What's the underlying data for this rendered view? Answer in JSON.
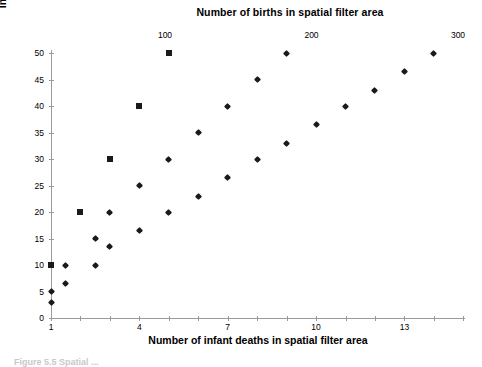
{
  "figure": {
    "top_axis": {
      "title": "Number of births in spatial filter area",
      "ticks": [
        {
          "label": "100",
          "value": 100
        },
        {
          "label": "200",
          "value": 200
        },
        {
          "label": "300",
          "value": 300
        }
      ]
    },
    "caption": "Figure 5.5   Spatial ..."
  },
  "chart_data": {
    "type": "scatter",
    "title": "",
    "xlabel": "Number of infant deaths in spatial filter area",
    "ylabel": "Infant mortality rate (/1000 births)",
    "top_xlabel": "Number of births in spatial filter area",
    "grid": false,
    "legend": "none",
    "xlim": [
      0.5,
      15.5
    ],
    "ylim": [
      0,
      50
    ],
    "yticks": [
      0,
      5,
      10,
      15,
      20,
      25,
      30,
      35,
      40,
      45,
      50
    ],
    "ytick_labels": [
      "0",
      "5",
      "10",
      "15",
      "20",
      "25",
      "30",
      "35",
      "40",
      "45",
      "50"
    ],
    "xticks": [
      1,
      2,
      3,
      4,
      5,
      6,
      7,
      8,
      9,
      10,
      11,
      12,
      13,
      14,
      15
    ],
    "xtick_labels": [
      "1",
      "",
      "",
      "4",
      "",
      "",
      "7",
      "",
      "",
      "10",
      "",
      "",
      "13",
      "",
      ""
    ],
    "top_xlim": [
      0,
      330
    ],
    "top_xticks": [
      100,
      200,
      300
    ],
    "top_xtick_labels": [
      "100",
      "200",
      "300"
    ],
    "series": [
      {
        "name": "Infant deaths (squares)",
        "marker": "square",
        "color": "#1a1a1a",
        "axis": "bottom",
        "points": [
          {
            "x": 1,
            "y": 10
          },
          {
            "x": 2,
            "y": 20
          },
          {
            "x": 3,
            "y": 30
          },
          {
            "x": 4,
            "y": 40
          },
          {
            "x": 5,
            "y": 50
          }
        ]
      },
      {
        "name": "Births (diamonds)",
        "marker": "diamond",
        "color": "#1a1a1a",
        "axis": "bottom",
        "points": [
          {
            "x": 1.0,
            "y": 5.0
          },
          {
            "x": 1.0,
            "y": 3.0
          },
          {
            "x": 1.5,
            "y": 10.0
          },
          {
            "x": 1.5,
            "y": 6.5
          },
          {
            "x": 2.5,
            "y": 10.0
          },
          {
            "x": 2.5,
            "y": 15.0
          },
          {
            "x": 3.0,
            "y": 13.5
          },
          {
            "x": 3.0,
            "y": 20.0
          },
          {
            "x": 4.0,
            "y": 16.5
          },
          {
            "x": 4.0,
            "y": 25.0
          },
          {
            "x": 5.0,
            "y": 20.0
          },
          {
            "x": 5.0,
            "y": 30.0
          },
          {
            "x": 6.0,
            "y": 23.0
          },
          {
            "x": 6.0,
            "y": 35.0
          },
          {
            "x": 7.0,
            "y": 26.5
          },
          {
            "x": 7.0,
            "y": 40.0
          },
          {
            "x": 8.0,
            "y": 30.0
          },
          {
            "x": 8.0,
            "y": 45.0
          },
          {
            "x": 9.0,
            "y": 33.0
          },
          {
            "x": 9.0,
            "y": 50.0
          },
          {
            "x": 10.0,
            "y": 36.5
          },
          {
            "x": 11.0,
            "y": 40.0
          },
          {
            "x": 12.0,
            "y": 43.0
          },
          {
            "x": 13.0,
            "y": 46.5
          },
          {
            "x": 14.0,
            "y": 50.0
          }
        ]
      }
    ]
  }
}
